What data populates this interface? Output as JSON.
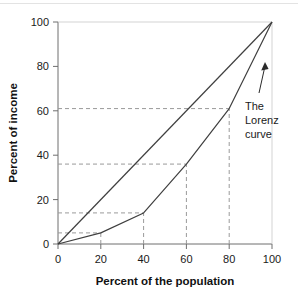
{
  "chart_data": {
    "type": "line",
    "title": "",
    "subtitle": "",
    "xlabel": "Percent of the population",
    "ylabel": "Percent of income",
    "xlim": [
      0,
      100
    ],
    "ylim": [
      0,
      100
    ],
    "xticks": [
      0,
      20,
      40,
      60,
      80,
      100
    ],
    "yticks": [
      0,
      20,
      40,
      60,
      80,
      100
    ],
    "xtick_labels": [
      "0",
      "20",
      "40",
      "60",
      "80",
      "100"
    ],
    "ytick_labels": [
      "0",
      "20",
      "40",
      "60",
      "80",
      "100"
    ],
    "grid": false,
    "legend_position": "none",
    "series": [
      {
        "name": "Line of perfect equality",
        "x": [
          0,
          100
        ],
        "values": [
          0,
          100
        ]
      },
      {
        "name": "The Lorenz curve",
        "x": [
          0,
          20,
          40,
          60,
          80,
          100
        ],
        "values": [
          0,
          5,
          14,
          36,
          61,
          100
        ]
      }
    ],
    "reference_lines": [
      {
        "x": 20,
        "y": 5
      },
      {
        "x": 40,
        "y": 14
      },
      {
        "x": 60,
        "y": 36
      },
      {
        "x": 80,
        "y": 61
      }
    ],
    "annotations": [
      {
        "text_lines": [
          "The",
          "Lorenz",
          "curve"
        ],
        "points_to_x": 88,
        "points_to_y": 78
      }
    ],
    "colors": {
      "line": "#3f3f3f",
      "dashed": "#9a9a9a",
      "axis": "#6e6e6e",
      "text": "#1a1a1a",
      "background": "#ffffff"
    }
  }
}
